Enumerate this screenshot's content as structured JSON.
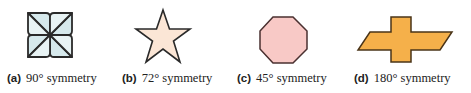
{
  "figures": [
    {
      "id": "a",
      "tag": "(a)",
      "caption": "90° symmetry",
      "shape": "pinwheel",
      "fill": "#d6e9ec",
      "stroke": "#2a2a2a"
    },
    {
      "id": "b",
      "tag": "(b)",
      "caption": "72° symmetry",
      "shape": "five-point-star",
      "fill": "#fbe6d6",
      "stroke": "#2a2a2a"
    },
    {
      "id": "c",
      "tag": "(c)",
      "caption": "45° symmetry",
      "shape": "octagon",
      "fill": "#f8c9c6",
      "stroke": "#4a3030"
    },
    {
      "id": "d",
      "tag": "(d)",
      "caption": "180° symmetry",
      "shape": "bowtie-cross",
      "fill": "#f5b04a",
      "stroke": "#4a3418"
    }
  ]
}
